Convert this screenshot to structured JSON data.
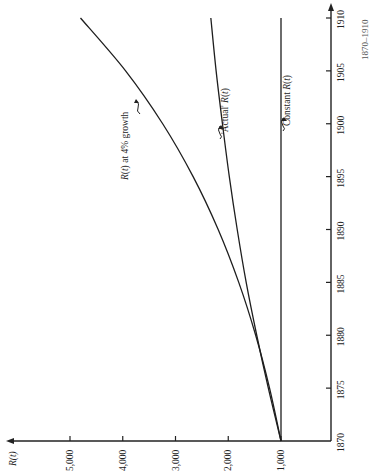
{
  "chart_data": {
    "type": "line",
    "orientation": "rotated 90° counter-clockwise (time axis vertical on right, R(t) axis horizontal at bottom, increasing leftward)",
    "title": "",
    "xlabel": "",
    "ylabel": "R(t)",
    "x": [
      1870,
      1875,
      1880,
      1885,
      1890,
      1895,
      1900,
      1905,
      1910
    ],
    "x_tick_labels": [
      "1870",
      "1875",
      "1880",
      "1885",
      "1890",
      "1895",
      "1900",
      "1905",
      "1910"
    ],
    "y_tick_values": [
      1000,
      2000,
      3000,
      4000,
      5000
    ],
    "y_tick_labels": [
      "1,000",
      "2,000",
      "3,000",
      "4,000",
      "5,000"
    ],
    "xlim": [
      1870,
      1910
    ],
    "ylim": [
      0,
      5300
    ],
    "grid": false,
    "legend": "none (inline annotations)",
    "series": [
      {
        "name": "R(t) at 4% growth",
        "values": [
          1000,
          1217,
          1480,
          1801,
          2191,
          2666,
          3243,
          3946,
          4801
        ]
      },
      {
        "name": "'Actual' R(t)",
        "values": [
          1000,
          1240,
          1460,
          1660,
          1830,
          1980,
          2110,
          2230,
          2330
        ]
      },
      {
        "name": "Constant R(t)",
        "values": [
          1000,
          1000,
          1000,
          1000,
          1000,
          1000,
          1000,
          1000,
          1000
        ]
      }
    ],
    "annotations": [
      {
        "text": "R(t) at 4% growth",
        "target_series": "R(t) at 4% growth",
        "near_year": 1904
      },
      {
        "text": "'Actual' R(t)",
        "target_series": "'Actual' R(t)",
        "near_year": 1898
      },
      {
        "text": "Constant R(t)",
        "target_series": "Constant R(t)",
        "near_year": 1899
      }
    ]
  },
  "labels": {
    "y_axis": "R(t)",
    "ann_growth": "R(t) at 4% growth",
    "ann_actual": "'Actual' R(t)",
    "ann_constant": "Constant R(t)",
    "caption_fragment": "1870–1910"
  }
}
